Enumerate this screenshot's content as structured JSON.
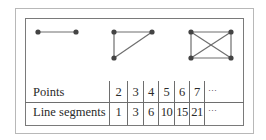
{
  "figures": [
    {
      "name": "two-points",
      "points": 2,
      "segments": 1
    },
    {
      "name": "three-points-triangle",
      "points": 3,
      "segments": 3
    },
    {
      "name": "four-points-complete",
      "points": 4,
      "segments": 6
    }
  ],
  "table": {
    "rows": [
      {
        "label": "Points",
        "values": [
          "2",
          "3",
          "4",
          "5",
          "6",
          "7",
          "···"
        ]
      },
      {
        "label": "Line segments",
        "values": [
          "1",
          "3",
          "6",
          "10",
          "15",
          "21",
          "···"
        ]
      }
    ]
  },
  "colors": {
    "line": "#6e6e6e",
    "dot": "#444444",
    "outer_border": "#b8b8b8",
    "inner_border": "#7a7a7a"
  }
}
